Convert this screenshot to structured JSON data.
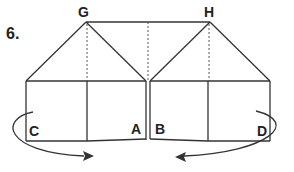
{
  "figure": {
    "number": "6.",
    "points": {
      "G": "G",
      "H": "H",
      "A": "A",
      "B": "B",
      "C": "C",
      "D": "D"
    },
    "line_color": "#333333"
  }
}
